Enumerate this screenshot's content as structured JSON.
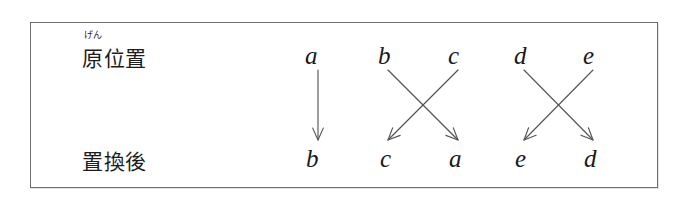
{
  "figure": {
    "type": "permutation-mapping-diagram",
    "frame_color": "#6f6f6f",
    "background_color": "#ffffff",
    "ink_color": "#1a1a1a",
    "arrow_color": "#555555",
    "rows": {
      "original": {
        "label": "原位置",
        "furigana": "げん",
        "letters": [
          "a",
          "b",
          "c",
          "d",
          "e"
        ]
      },
      "result": {
        "label": "置換後",
        "letters": [
          "b",
          "c",
          "a",
          "e",
          "d"
        ]
      }
    },
    "mappings": [
      {
        "from": "a",
        "from_index": 0,
        "to_index": 0,
        "to": "b"
      },
      {
        "from": "b",
        "from_index": 1,
        "to_index": 2,
        "to": "a"
      },
      {
        "from": "c",
        "from_index": 2,
        "to_index": 1,
        "to": "c"
      },
      {
        "from": "d",
        "from_index": 3,
        "to_index": 4,
        "to": "d"
      },
      {
        "from": "e",
        "from_index": 4,
        "to_index": 3,
        "to": "e"
      }
    ],
    "columns_x": [
      312,
      382,
      452,
      518,
      587
    ]
  }
}
